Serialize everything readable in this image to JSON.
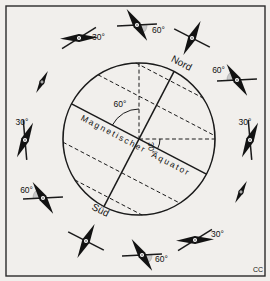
{
  "figure": {
    "credit": "CC"
  },
  "style": {
    "background": "#f1efec",
    "border_color": "#2b2b2b",
    "line_color": "#1a1a1a",
    "wedge_color": "#c8c8c8",
    "needle_color": "#121212"
  },
  "globe": {
    "labels": {
      "north": "Nord",
      "south": "Süd",
      "equator": "Magnetischer Äquator",
      "axis_angle": "60°",
      "equator_angle": "30°"
    }
  },
  "needles": [
    {
      "id": "upper-left-30",
      "cx": 79,
      "cy": 38,
      "line_angle": -32,
      "needle_angle": -2,
      "kind": "standard",
      "wedge": null,
      "label": {
        "text": "30°",
        "dx": 13,
        "dy": 2,
        "anchor": "start"
      }
    },
    {
      "id": "top-60",
      "cx": 137,
      "cy": 25,
      "line_angle": -3,
      "needle_angle": 57,
      "kind": "standard",
      "wedge": [
        -3,
        57
      ],
      "label": {
        "text": "60°",
        "dx": 15,
        "dy": 8,
        "anchor": "start"
      }
    },
    {
      "id": "north-pole",
      "cx": 192,
      "cy": 38,
      "line_angle": 27,
      "needle_angle": 117,
      "kind": "standard",
      "wedge": null,
      "label": null
    },
    {
      "id": "upper-right-60",
      "cx": 237,
      "cy": 80,
      "line_angle": -3,
      "needle_angle": 57,
      "kind": "standard",
      "wedge": [
        177,
        237
      ],
      "label": {
        "text": "60°",
        "dx": -12,
        "dy": -7,
        "anchor": "end"
      }
    },
    {
      "id": "right-30",
      "cx": 250,
      "cy": 140,
      "line_angle": 85,
      "needle_angle": 115,
      "kind": "standard",
      "wedge": null,
      "label": {
        "text": "30°",
        "dx": -5,
        "dy": -15,
        "anchor": "middle"
      }
    },
    {
      "id": "right-equator",
      "cx": 241,
      "cy": 192,
      "line_angle": null,
      "needle_angle": -62,
      "kind": "slim",
      "wedge": null,
      "label": null
    },
    {
      "id": "lower-right-30",
      "cx": 195,
      "cy": 240,
      "line_angle": -32,
      "needle_angle": -2,
      "kind": "standard",
      "wedge": null,
      "label": {
        "text": "30°",
        "dx": 16,
        "dy": -3,
        "anchor": "start"
      }
    },
    {
      "id": "bottom-60",
      "cx": 142,
      "cy": 255,
      "line_angle": -3,
      "needle_angle": 57,
      "kind": "standard",
      "wedge": [
        -3,
        57
      ],
      "label": {
        "text": "60°",
        "dx": 13,
        "dy": 7,
        "anchor": "start"
      }
    },
    {
      "id": "south-pole",
      "cx": 86,
      "cy": 241,
      "line_angle": 27,
      "needle_angle": 117,
      "kind": "standard",
      "wedge": null,
      "label": null
    },
    {
      "id": "lower-left-60",
      "cx": 43,
      "cy": 198,
      "line_angle": -3,
      "needle_angle": 57,
      "kind": "standard",
      "wedge": [
        177,
        237
      ],
      "label": {
        "text": "60°",
        "dx": -10,
        "dy": -5,
        "anchor": "end"
      }
    },
    {
      "id": "left-30",
      "cx": 25,
      "cy": 140,
      "line_angle": 85,
      "needle_angle": 115,
      "kind": "standard",
      "wedge": null,
      "label": {
        "text": "30°",
        "dx": -3,
        "dy": -15,
        "anchor": "middle"
      }
    },
    {
      "id": "left-equator",
      "cx": 42,
      "cy": 82,
      "line_angle": null,
      "needle_angle": -62,
      "kind": "slim",
      "wedge": null,
      "label": null
    }
  ]
}
